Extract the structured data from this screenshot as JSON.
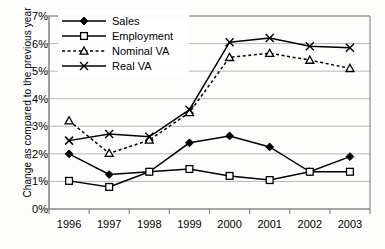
{
  "chart_data": {
    "type": "line",
    "title": "",
    "xlabel": "",
    "ylabel": "Change as compared to the previous year",
    "categories": [
      "1996",
      "1997",
      "1998",
      "1999",
      "2000",
      "2001",
      "2002",
      "2003"
    ],
    "x": [
      1996,
      1997,
      1998,
      1999,
      2000,
      2001,
      2002,
      2003
    ],
    "ylim": [
      0,
      7
    ],
    "yticks": [
      "0%",
      "1%",
      "2%",
      "3%",
      "4%",
      "5%",
      "6%",
      "7%"
    ],
    "ytick_values": [
      0,
      1,
      2,
      3,
      4,
      5,
      6,
      7
    ],
    "y_unit": "%",
    "grid": "horizontal",
    "legend_position": "top-left-inside",
    "series": [
      {
        "name": "Sales",
        "marker": "filled-diamond",
        "line_style": "solid",
        "values": [
          2.0,
          1.25,
          1.35,
          2.4,
          2.65,
          2.25,
          1.35,
          1.9
        ]
      },
      {
        "name": "Employment",
        "marker": "open-square",
        "line_style": "solid",
        "values": [
          1.02,
          0.8,
          1.35,
          1.45,
          1.2,
          1.05,
          1.35,
          1.35
        ]
      },
      {
        "name": "Nominal VA",
        "marker": "open-triangle",
        "line_style": "dashed",
        "values": [
          3.2,
          2.02,
          2.5,
          3.5,
          5.5,
          5.65,
          5.4,
          5.1
        ]
      },
      {
        "name": "Real VA",
        "marker": "cross-x",
        "line_style": "solid",
        "values": [
          2.48,
          2.72,
          2.62,
          3.6,
          6.05,
          6.2,
          5.9,
          5.85
        ]
      }
    ]
  },
  "colors": {
    "line": "#000000",
    "grid": "#b8b8b8",
    "axis": "#8a8a8a",
    "background": "#fdfdfc",
    "text": "#000000"
  }
}
